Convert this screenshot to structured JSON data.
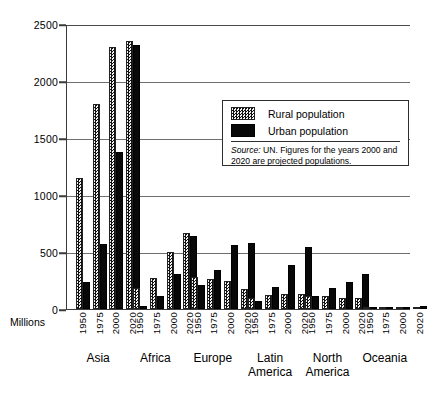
{
  "chart_data": {
    "type": "bar",
    "title": "",
    "subtitle": "",
    "xlabel": "",
    "ylabel": "Millions",
    "ylim": [
      0,
      2500
    ],
    "yticks": [
      0,
      500,
      1000,
      1500,
      2000,
      2500
    ],
    "grid": true,
    "legend_position": "inside-upper-right",
    "categories": [
      "Asia",
      "Africa",
      "Europe",
      "Latin America",
      "North America",
      "Oceania"
    ],
    "subcategories": [
      "1950",
      "1975",
      "2000",
      "2020"
    ],
    "series": [
      {
        "name": "Rural population",
        "color": "#6a6a6a",
        "pattern": "checkered",
        "values": {
          "Asia": [
            1150,
            1800,
            2300,
            2350
          ],
          "Africa": [
            180,
            270,
            500,
            670
          ],
          "Europe": [
            280,
            265,
            250,
            175
          ],
          "Latin America": [
            100,
            120,
            130,
            130
          ],
          "North America": [
            110,
            110,
            100,
            95
          ],
          "Oceania": [
            5,
            6,
            8,
            10
          ]
        }
      },
      {
        "name": "Urban population",
        "color": "#080808",
        "pattern": "solid",
        "values": {
          "Asia": [
            240,
            570,
            1380,
            2320
          ],
          "Africa": [
            30,
            110,
            310,
            640
          ],
          "Europe": [
            210,
            340,
            560,
            580
          ],
          "Latin America": [
            70,
            190,
            390,
            540
          ],
          "North America": [
            110,
            180,
            240,
            310
          ],
          "Oceania": [
            8,
            14,
            20,
            28
          ]
        }
      }
    ],
    "annotations": [
      "Source: UN. Figures for the years 2000 and 2020 are projected populations."
    ]
  },
  "axis": {
    "y_label": "Millions",
    "y_ticks": [
      "0",
      "500",
      "1000",
      "1500",
      "2000",
      "2500"
    ]
  },
  "legend": {
    "rural_label": "Rural population",
    "urban_label": "Urban population",
    "source_prefix": "Source:",
    "source_text": " UN. Figures for the years 2000 and 2020 are projected populations."
  },
  "regions": [
    {
      "label": "Asia"
    },
    {
      "label": "Africa"
    },
    {
      "label": "Europe"
    },
    {
      "label": "Latin\nAmerica"
    },
    {
      "label": "North\nAmerica"
    },
    {
      "label": "Oceania"
    }
  ],
  "years": [
    "1950",
    "1975",
    "2000",
    "2020"
  ]
}
